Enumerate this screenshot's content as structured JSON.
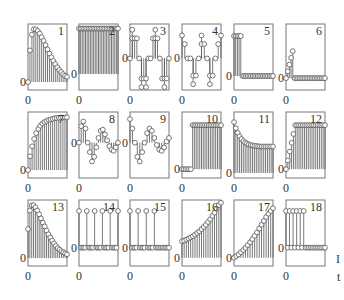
{
  "figure": {
    "edge_text": [
      "I",
      "t"
    ]
  },
  "chart_data": [
    {
      "type": "stem",
      "id": "1",
      "title": "1",
      "xtick": "0",
      "ytick": "0",
      "ylim": [
        -0.15,
        1.1
      ],
      "values": [
        0,
        0.6,
        0.9,
        1.0,
        1.0,
        0.97,
        0.92,
        0.85,
        0.78,
        0.7,
        0.62,
        0.54,
        0.47,
        0.4,
        0.34,
        0.28,
        0.23,
        0.19,
        0.15,
        0.12,
        0.1
      ]
    },
    {
      "type": "stem",
      "id": "2",
      "title": "2",
      "xtick": "0",
      "ytick": "0",
      "ylim": [
        -0.35,
        1.1
      ],
      "values": [
        1,
        1,
        1,
        1,
        1,
        1,
        1,
        1,
        1,
        1,
        1,
        1,
        1,
        1,
        1,
        1,
        1,
        1,
        1,
        1,
        1,
        1,
        1,
        1,
        1
      ]
    },
    {
      "type": "stem",
      "id": "3",
      "title": "3",
      "xtick": "0",
      "ytick": "0",
      "ylim": [
        -1.1,
        1.2
      ],
      "values": [
        0,
        0.7,
        0.7,
        0.7,
        0,
        -0.7,
        -0.7,
        -0.7,
        0,
        0,
        0.7,
        0.7,
        0.7,
        0,
        -0.7,
        -0.7,
        -0.7,
        0
      ],
      "extra": [
        null,
        1.0,
        null,
        null,
        null,
        -1.0,
        null,
        -1.0,
        null,
        null,
        null,
        1.0,
        null,
        null,
        null,
        -1.0,
        null,
        null
      ]
    },
    {
      "type": "stem",
      "id": "4",
      "title": "4",
      "xtick": "0",
      "ytick": "0",
      "ylim": [
        -1.1,
        1.2
      ],
      "values": [
        0.8,
        0.5,
        0,
        0,
        -0.6,
        -0.6,
        0,
        0.5,
        0.5,
        0,
        -0.6,
        -0.6,
        0,
        0.5,
        0.8
      ],
      "extra": [
        null,
        null,
        null,
        null,
        -0.9,
        null,
        null,
        0.8,
        null,
        null,
        -0.9,
        null,
        null,
        null,
        null
      ]
    },
    {
      "type": "stem",
      "id": "5",
      "title": "5",
      "xtick": "0",
      "ytick": "0",
      "ylim": [
        -0.35,
        1.3
      ],
      "values": [
        1,
        1,
        1,
        1,
        1,
        0,
        0,
        0,
        0,
        0,
        0,
        0,
        0,
        0,
        0,
        0,
        0,
        0,
        0,
        0,
        0,
        0,
        0,
        0
      ]
    },
    {
      "type": "stem",
      "id": "6",
      "title": "6",
      "xtick": "0",
      "ytick": "0",
      "ylim": [
        -0.35,
        1.6
      ],
      "values": [
        0,
        0.2,
        0.4,
        0.6,
        0.8,
        0,
        0,
        0,
        0,
        0,
        0,
        0,
        0,
        0,
        0,
        0,
        0,
        0,
        0,
        0,
        0,
        0,
        0,
        0
      ]
    },
    {
      "type": "stem",
      "id": "7",
      "title": "7",
      "xtick": "0",
      "ytick": "0",
      "ylim": [
        -0.15,
        1.1
      ],
      "values": [
        0,
        0.26,
        0.45,
        0.59,
        0.7,
        0.78,
        0.84,
        0.88,
        0.91,
        0.93,
        0.95,
        0.96,
        0.97,
        0.98,
        0.985,
        0.99,
        0.993,
        0.995,
        0.997,
        0.998
      ]
    },
    {
      "type": "stem",
      "id": "8",
      "title": "8",
      "xtick": "0",
      "ytick": "0",
      "ylim": [
        -1.5,
        1.3
      ],
      "values": [
        0,
        0.7,
        0.9,
        0.6,
        0,
        -0.4,
        -0.8,
        -0.6,
        -0.2,
        0.2,
        0.5,
        0.55,
        0.35,
        0.1,
        -0.15,
        -0.3,
        -0.35,
        -0.2,
        0
      ]
    },
    {
      "type": "stem",
      "id": "9",
      "title": "9",
      "xtick": "0",
      "ytick": "0",
      "ylim": [
        -1.5,
        1.3
      ],
      "values": [
        1.0,
        0.6,
        0,
        -0.6,
        -0.8,
        -0.4,
        0,
        0.4,
        0.6,
        0.5,
        0.2,
        -0.1,
        -0.3,
        -0.35,
        -0.2,
        0.05,
        0.2
      ]
    },
    {
      "type": "stem",
      "id": "10",
      "title": "10",
      "xtick": "0",
      "ytick": "0",
      "ylim": [
        -0.2,
        1.3
      ],
      "values": [
        0,
        0,
        0,
        0,
        0,
        0,
        1,
        1,
        1,
        1,
        1,
        1,
        1,
        1,
        1,
        1,
        1,
        1,
        1,
        1,
        1,
        1,
        1
      ]
    },
    {
      "type": "stem",
      "id": "11",
      "title": "11",
      "xtick": "0",
      "ytick": "0",
      "ylim": [
        -0.1,
        1.2
      ],
      "values": [
        1,
        0.88,
        0.79,
        0.72,
        0.67,
        0.63,
        0.6,
        0.58,
        0.56,
        0.55,
        0.54,
        0.535,
        0.53,
        0.525,
        0.52,
        0.52,
        0.52,
        0.52,
        0.52,
        0.52,
        0.52,
        0.52
      ]
    },
    {
      "type": "stem",
      "id": "12",
      "title": "12",
      "xtick": "0",
      "ytick": "0",
      "ylim": [
        -0.2,
        1.3
      ],
      "values": [
        0,
        0.2,
        0.4,
        0.6,
        0.8,
        1,
        1,
        1,
        1,
        1,
        1,
        1,
        1,
        1,
        1,
        1,
        1,
        1,
        1,
        1,
        1,
        1
      ]
    },
    {
      "type": "stem",
      "id": "13",
      "title": "13",
      "xtick": "0",
      "ytick": "0",
      "ylim": [
        -0.15,
        1.1
      ],
      "values": [
        0.55,
        0.9,
        1.0,
        1.0,
        0.96,
        0.9,
        0.83,
        0.75,
        0.67,
        0.6,
        0.52,
        0.45,
        0.39,
        0.33,
        0.28,
        0.23,
        0.19,
        0.16,
        0.13,
        0.11,
        0.09,
        0.07
      ]
    },
    {
      "type": "stem",
      "id": "14",
      "title": "14",
      "xtick": "0",
      "ytick": "0",
      "ylim": [
        -0.5,
        1.3
      ],
      "values": [
        1,
        0,
        0,
        0,
        0,
        1,
        0,
        0,
        0,
        0,
        1,
        0,
        0,
        0,
        0,
        1,
        0,
        0,
        0,
        0,
        1,
        0,
        0,
        0,
        0,
        1
      ]
    },
    {
      "type": "stem",
      "id": "15",
      "title": "15",
      "xtick": "0",
      "ytick": "0",
      "ylim": [
        -0.5,
        1.3
      ],
      "values": [
        1,
        0,
        0,
        0,
        0,
        1,
        0,
        0,
        0,
        0,
        1,
        0,
        0,
        0,
        0,
        1,
        0,
        0,
        0,
        0,
        0,
        0,
        0,
        0,
        0
      ]
    },
    {
      "type": "stem",
      "id": "16",
      "title": "16",
      "xtick": "0",
      "ytick": "0",
      "ylim": [
        -0.15,
        1.05
      ],
      "values": [
        0.3,
        0.31,
        0.33,
        0.35,
        0.37,
        0.39,
        0.42,
        0.45,
        0.48,
        0.52,
        0.56,
        0.6,
        0.65,
        0.7,
        0.76,
        0.82,
        0.89,
        0.96,
        1.0
      ]
    },
    {
      "type": "stem",
      "id": "17",
      "title": "17",
      "xtick": "0",
      "ytick": "0",
      "ylim": [
        -0.15,
        1.05
      ],
      "values": [
        0,
        0.03,
        0.06,
        0.1,
        0.14,
        0.18,
        0.23,
        0.28,
        0.34,
        0.4,
        0.46,
        0.53,
        0.6,
        0.67,
        0.74,
        0.8,
        0.85,
        0.9
      ]
    },
    {
      "type": "stem",
      "id": "18",
      "title": "18",
      "xtick": "0",
      "ytick": "0",
      "ylim": [
        -0.5,
        1.3
      ],
      "values": [
        1,
        0,
        1,
        0,
        1,
        0,
        1,
        0,
        1,
        0,
        1,
        0,
        0,
        0,
        0,
        0,
        0,
        0,
        0,
        0,
        0,
        0,
        0
      ]
    }
  ]
}
